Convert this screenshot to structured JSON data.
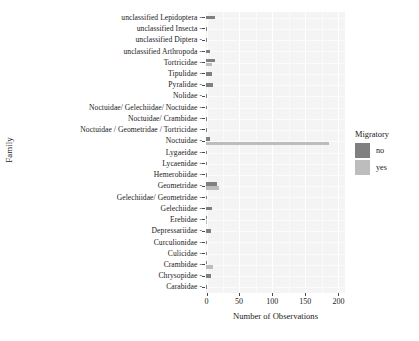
{
  "chart_data": {
    "type": "bar",
    "orientation": "horizontal",
    "title": "",
    "xlabel": "Number of Observations",
    "ylabel": "Family",
    "xlim": [
      0,
      210
    ],
    "xticks": [
      0,
      50,
      100,
      150,
      200
    ],
    "xtick_labels": [
      "0",
      "50",
      "100",
      "150",
      "200"
    ],
    "grid": true,
    "legend": {
      "title": "Migratory",
      "position": "right",
      "entries": [
        {
          "label": "no",
          "color": "#808080"
        },
        {
          "label": "yes",
          "color": "#bdbdbd"
        }
      ]
    },
    "categories": [
      "unclassified Lepidoptera",
      "unclassified Insecta",
      "unclassified Diptera",
      "unclassified Arthropoda",
      "Tortricidae",
      "Tipulidae",
      "Pyralidae",
      "Nolidae",
      "Noctuidae/ Gelechiidae/ Noctuidae",
      "Noctuidae/ Crambidae",
      "Noctuidae / Geometridae / Tortricidae",
      "Noctuidae",
      "Lygaeidae",
      "Lycaenidae",
      "Hemerobiidae",
      "Geometridae",
      "Gelechiidae/ Geometridae",
      "Gelechiidae",
      "Erebidae",
      "Depressariidae",
      "Curculionidae",
      "Culicidae",
      "Crambidae",
      "Chrysopidae",
      "Carabidae"
    ],
    "series": [
      {
        "name": "no",
        "color": "#808080",
        "values": [
          13,
          1,
          1,
          6,
          13,
          9,
          10,
          1,
          1,
          1,
          1,
          6,
          2,
          1,
          1,
          16,
          1,
          9,
          1,
          7,
          2,
          1,
          2,
          7,
          1
        ]
      },
      {
        "name": "yes",
        "color": "#bdbdbd",
        "values": [
          0,
          0,
          0,
          0,
          9,
          0,
          0,
          0,
          0,
          0,
          0,
          186,
          0,
          0,
          0,
          19,
          0,
          0,
          2,
          0,
          0,
          0,
          11,
          0,
          0
        ]
      }
    ]
  }
}
